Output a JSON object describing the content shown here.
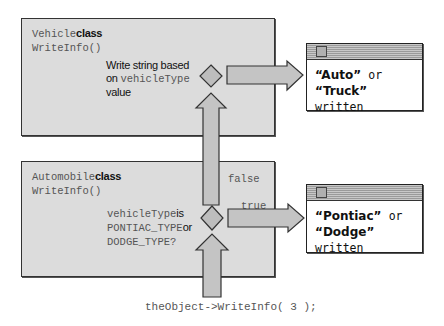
{
  "vehicle_box": {
    "class_name": "Vehicle",
    "class_word": "class",
    "method": "WriteInfo()",
    "condition": {
      "line1": "Write string based",
      "line2_prefix": "on",
      "line2_code": "vehicleType",
      "line3": "value"
    }
  },
  "automobile_box": {
    "class_name": "Automobile",
    "class_word": "class",
    "method": "WriteInfo()",
    "condition": {
      "line1_code": "vehicleType",
      "line1_suffix": "is",
      "line2_code": "PONTIAC_TYPE",
      "line2_suffix": "or",
      "line3_code": "DODGE_TYPE?"
    },
    "false_label": "false",
    "true_label": "true"
  },
  "output_windows": [
    {
      "line1_quoted": "“Auto”",
      "line1_rest": "or",
      "line2_quoted": "“Truck”",
      "line2_rest": "written"
    },
    {
      "line1_quoted": "“Pontiac”",
      "line1_rest": "or",
      "line2_quoted": "“Dodge”",
      "line2_rest": "written"
    }
  ],
  "caption": "theObject->WriteInfo( 3 );",
  "colors": {
    "box_fill": "#dcdcdc",
    "arrow_fill": "#c4c4c4",
    "diamond_fill": "#bdbdbd",
    "outline": "#333333"
  }
}
